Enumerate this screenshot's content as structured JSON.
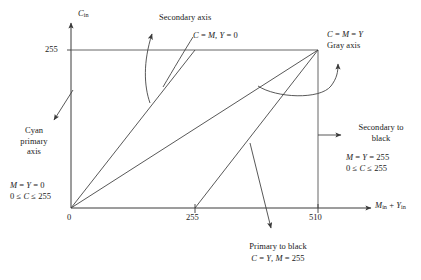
{
  "figure": {
    "type": "diagram",
    "axes": {
      "y_axis_label": "C",
      "y_axis_label_sub": "in",
      "x_axis_label_part1": "M",
      "x_axis_label_sub1": "in",
      "x_axis_label_plus": " + ",
      "x_axis_label_part2": "Y",
      "x_axis_label_sub2": "in",
      "y_ticks": [
        "255"
      ],
      "x_ticks": [
        "0",
        "255",
        "510"
      ],
      "x_range": [
        0,
        510
      ],
      "y_range": [
        0,
        255
      ]
    },
    "lines": [
      {
        "name": "secondary-axis-line",
        "from": [
          0,
          0
        ],
        "to": [
          255,
          255
        ],
        "label": "C = M, Y = 0"
      },
      {
        "name": "gray-axis-line",
        "from": [
          0,
          0
        ],
        "to": [
          510,
          255
        ],
        "label": "C = M = Y"
      },
      {
        "name": "primary-to-black-line",
        "from": [
          255,
          0
        ],
        "to": [
          510,
          255
        ],
        "label": "C = Y, M = 255"
      }
    ],
    "annotations": {
      "secondary_axis": {
        "title": "Secondary axis",
        "equation": "C = M, Y = 0"
      },
      "gray_axis": {
        "equation": "C = M = Y",
        "title": "Gray axis"
      },
      "cyan_primary": {
        "line1": "Cyan",
        "line2": "primary",
        "line3": "axis",
        "eq1": "M = Y = 0",
        "eq2": "0 ≤ C ≤ 255"
      },
      "secondary_to_black": {
        "line1": "Secondary to",
        "line2": "black",
        "eq1": "M = Y = 255",
        "eq2": "0 ≤ C ≤ 255"
      },
      "primary_to_black": {
        "title": "Primary to black",
        "equation": "C = Y, M = 255"
      }
    },
    "colors": {
      "stroke": "#3a3a3a",
      "text": "#1a1a1a",
      "background": "#ffffff"
    }
  }
}
